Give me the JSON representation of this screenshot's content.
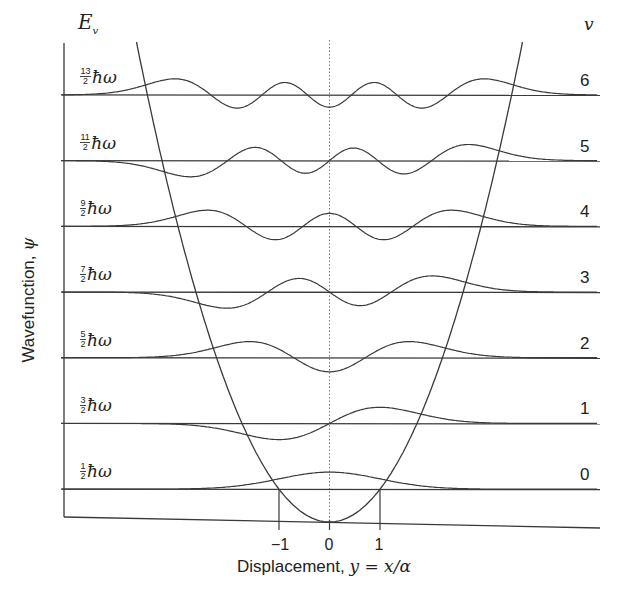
{
  "chart_data": {
    "type": "line",
    "xlabel": "Displacement, y = x/α",
    "ylabel": "Wavefunction, ψ",
    "y_axis_header": "E_v",
    "right_axis_header": "v",
    "x_ticks": [
      "−1",
      "0",
      "1"
    ],
    "x_tick_values": [
      -1,
      0,
      1
    ],
    "xlim": [
      -5.5,
      5.4
    ],
    "grid": false,
    "center_line": "dotted at y = 0",
    "potential": "V = ½ y² ħω (parabola)",
    "levels": [
      {
        "v": 0,
        "energy_label_num": "1",
        "energy_label_den": "2",
        "energy": 0.5
      },
      {
        "v": 1,
        "energy_label_num": "3",
        "energy_label_den": "2",
        "energy": 1.5
      },
      {
        "v": 2,
        "energy_label_num": "5",
        "energy_label_den": "2",
        "energy": 2.5
      },
      {
        "v": 3,
        "energy_label_num": "7",
        "energy_label_den": "2",
        "energy": 3.5
      },
      {
        "v": 4,
        "energy_label_num": "9",
        "energy_label_den": "2",
        "energy": 4.5
      },
      {
        "v": 5,
        "energy_label_num": "11",
        "energy_label_den": "2",
        "energy": 5.5
      },
      {
        "v": 6,
        "energy_label_num": "13",
        "energy_label_den": "2",
        "energy": 6.5
      }
    ],
    "series_note": "Each level shows ψ_v(y) = N H_v(y) exp(−y²/2) drawn on its energy baseline"
  },
  "labels": {
    "ev_main": "E",
    "ev_sub": "v",
    "v_head": "v",
    "hbar_omega": "ħω",
    "xlabel_text": "Displacement, ",
    "xlabel_math": "y = x/α",
    "ylabel_text": "Wavefunction, ",
    "ylabel_math": "ψ",
    "tick_m1": "−1",
    "tick_0": "0",
    "tick_1": "1"
  },
  "layout": {
    "x0": 329.5,
    "unit_px": 50.5,
    "bottom_y": 522,
    "level_spacing": 65.7,
    "left_axis_x": 64,
    "right_end_x": 600,
    "amp_px": 17,
    "stroke": "#3a3a3a"
  }
}
